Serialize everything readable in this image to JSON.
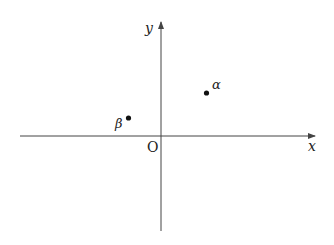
{
  "diagram": {
    "type": "coordinate-plane",
    "axes": {
      "x_label": "x",
      "y_label": "y",
      "origin_label": "O",
      "color": "#444444"
    },
    "points": [
      {
        "name": "alpha",
        "label": "α",
        "quadrant": "I"
      },
      {
        "name": "beta",
        "label": "β",
        "quadrant": "II"
      }
    ],
    "point_color": "#111111"
  }
}
